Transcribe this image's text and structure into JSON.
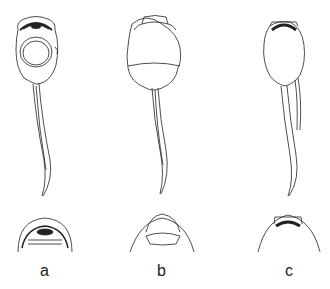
{
  "figure": {
    "panels": [
      {
        "id": "a",
        "label": "a",
        "description": "tadpole ventral view with large oral disc"
      },
      {
        "id": "b",
        "label": "b",
        "description": "tadpole dorsal view with funnel mouth"
      },
      {
        "id": "c",
        "label": "c",
        "description": "tadpole ventral view with dark jaw sheath"
      }
    ],
    "colors": {
      "line": "#222222",
      "background": "#ffffff"
    }
  }
}
